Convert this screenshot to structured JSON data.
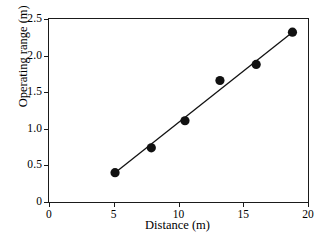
{
  "chart_data": {
    "type": "scatter",
    "title": "",
    "xlabel": "Distance (m)",
    "ylabel": "Operating range (m)",
    "xlim": [
      0,
      20
    ],
    "ylim": [
      0,
      2.5
    ],
    "xticks": [
      0,
      5,
      10,
      15,
      20
    ],
    "yticks": [
      0,
      0.5,
      1.0,
      1.5,
      2.0,
      2.5
    ],
    "xticklabels": [
      "0",
      "5",
      "10",
      "15",
      "20"
    ],
    "yticklabels": [
      "0",
      "0.5",
      "1.0",
      "1.5",
      "2.0",
      "2.5"
    ],
    "grid": false,
    "legend": null,
    "marker": "filled-circle",
    "marker_color": "#111111",
    "line_color": "#111111",
    "background_color": "#ffffff",
    "x": [
      5.1,
      7.9,
      10.5,
      13.2,
      16.0,
      18.8
    ],
    "y": [
      0.4,
      0.74,
      1.11,
      1.66,
      1.88,
      2.32
    ],
    "series": [
      {
        "name": "Operating range vs distance",
        "points": [
          {
            "x": 5.1,
            "y": 0.4
          },
          {
            "x": 7.9,
            "y": 0.74
          },
          {
            "x": 10.5,
            "y": 1.11
          },
          {
            "x": 13.2,
            "y": 1.66
          },
          {
            "x": 16.0,
            "y": 1.88
          },
          {
            "x": 18.8,
            "y": 2.32
          }
        ]
      }
    ],
    "fit_line": {
      "type": "linear",
      "x0": 5.1,
      "y0": 0.4,
      "x1": 18.8,
      "y1": 2.32
    }
  }
}
